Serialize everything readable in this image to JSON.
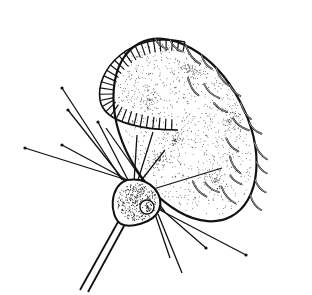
{
  "figure": {
    "type": "scientific-line-drawing",
    "background": "#ffffff",
    "ink": "#111111",
    "width": 312,
    "height": 295
  },
  "ciliate": {
    "body": {
      "cx": 185,
      "cy": 130,
      "rx": 62,
      "ry": 98,
      "rotate": -28
    },
    "membranelle_fringe": {
      "count": 34
    },
    "cirri_count": 22,
    "stipple_density": 900
  },
  "predator": {
    "cell": {
      "cx": 135,
      "cy": 202,
      "rx": 24,
      "ry": 22
    },
    "nucleus": {
      "cx": 147,
      "cy": 207,
      "r": 7
    },
    "stalk": [
      [
        118,
        222,
        80,
        290
      ],
      [
        124,
        226,
        88,
        292
      ]
    ],
    "tentacles": [
      [
        127,
        180,
        25,
        148,
        1
      ],
      [
        127,
        180,
        62,
        145,
        1
      ],
      [
        125,
        182,
        68,
        110,
        1
      ],
      [
        122,
        180,
        62,
        88,
        1
      ],
      [
        128,
        180,
        98,
        122,
        1
      ],
      [
        134,
        182,
        137,
        135,
        0
      ],
      [
        138,
        180,
        153,
        132,
        0
      ],
      [
        140,
        182,
        165,
        150,
        0
      ],
      [
        150,
        190,
        222,
        168,
        0
      ],
      [
        160,
        208,
        206,
        248,
        1
      ],
      [
        160,
        210,
        246,
        255,
        1
      ],
      [
        158,
        214,
        182,
        273,
        0
      ],
      [
        155,
        214,
        170,
        258,
        0
      ],
      [
        106,
        128,
        165,
        212,
        0
      ]
    ]
  }
}
